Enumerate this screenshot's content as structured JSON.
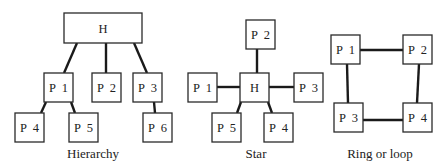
{
  "diagrams": {
    "hierarchy": {
      "caption": "Hierarchy",
      "nodes": {
        "H": "H",
        "P1": "P  1",
        "P2": "P  2",
        "P3": "P  3",
        "P4": "P  4",
        "P5": "P  5",
        "P6": "P  6"
      },
      "edges": [
        [
          "H",
          "P1"
        ],
        [
          "H",
          "P2"
        ],
        [
          "H",
          "P3"
        ],
        [
          "P1",
          "P4"
        ],
        [
          "P1",
          "P5"
        ],
        [
          "P3",
          "P6"
        ]
      ]
    },
    "star": {
      "caption": "Star",
      "nodes": {
        "H": "H",
        "P1": "P  1",
        "P2": "P  2",
        "P3": "P  3",
        "P4": "P  4",
        "P5": "P  5"
      },
      "edges": [
        [
          "H",
          "P1"
        ],
        [
          "H",
          "P2"
        ],
        [
          "H",
          "P3"
        ],
        [
          "H",
          "P4"
        ],
        [
          "H",
          "P5"
        ]
      ]
    },
    "ring": {
      "caption": "Ring or loop",
      "nodes": {
        "P1": "P  1",
        "P2": "P  2",
        "P3": "P  3",
        "P4": "P  4"
      },
      "edges": [
        [
          "P1",
          "P2"
        ],
        [
          "P2",
          "P4"
        ],
        [
          "P4",
          "P3"
        ],
        [
          "P3",
          "P1"
        ]
      ]
    }
  }
}
